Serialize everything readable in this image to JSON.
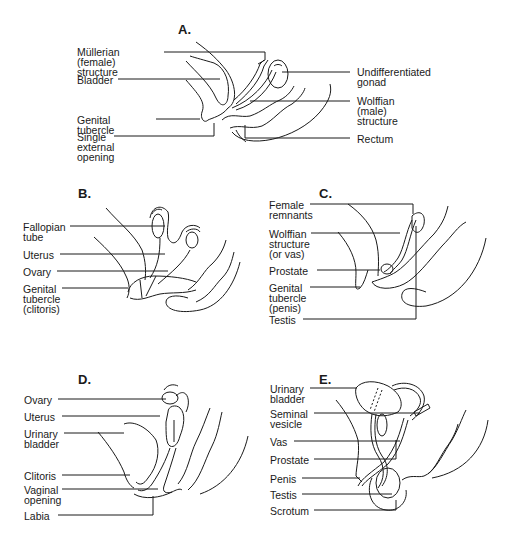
{
  "panels": [
    {
      "id": "A",
      "title": "A.",
      "labels": [
        {
          "text": "Müllerian (female)\nstructure",
          "side": "left"
        },
        {
          "text": "Bladder",
          "side": "left"
        },
        {
          "text": "Genital tubercle",
          "side": "left"
        },
        {
          "text": "Single\nexternal\nopening",
          "side": "left"
        },
        {
          "text": "Undifferentiated\ngonad",
          "side": "right"
        },
        {
          "text": "Wolffian\n(male)\nstructure",
          "side": "right"
        },
        {
          "text": "Rectum",
          "side": "right"
        }
      ]
    },
    {
      "id": "B",
      "title": "B.",
      "labels": [
        {
          "text": "Fallopian\ntube",
          "side": "left"
        },
        {
          "text": "Uterus",
          "side": "left"
        },
        {
          "text": "Ovary",
          "side": "left"
        },
        {
          "text": "Genital\ntubercle\n(clitoris)",
          "side": "left"
        }
      ]
    },
    {
      "id": "C",
      "title": "C.",
      "labels": [
        {
          "text": "Female\nremnants",
          "side": "left"
        },
        {
          "text": "Wolffian\nstructure\n(or vas)",
          "side": "left"
        },
        {
          "text": "Prostate",
          "side": "left"
        },
        {
          "text": "Genital\ntubercle\n(penis)",
          "side": "left"
        },
        {
          "text": "Testis",
          "side": "left"
        }
      ]
    },
    {
      "id": "D",
      "title": "D.",
      "labels": [
        {
          "text": "Ovary",
          "side": "left"
        },
        {
          "text": "Uterus",
          "side": "left"
        },
        {
          "text": "Urinary\nbladder",
          "side": "left"
        },
        {
          "text": "Clitoris",
          "side": "left"
        },
        {
          "text": "Vaginal\nopening",
          "side": "left"
        },
        {
          "text": "Labia",
          "side": "left"
        }
      ]
    },
    {
      "id": "E",
      "title": "E.",
      "labels": [
        {
          "text": "Urinary\nbladder",
          "side": "left"
        },
        {
          "text": "Seminal\nvesicle",
          "side": "left"
        },
        {
          "text": "Vas",
          "side": "left"
        },
        {
          "text": "Prostate",
          "side": "left"
        },
        {
          "text": "Penis",
          "side": "left"
        },
        {
          "text": "Testis",
          "side": "left"
        },
        {
          "text": "Scrotum",
          "side": "left"
        }
      ]
    }
  ]
}
